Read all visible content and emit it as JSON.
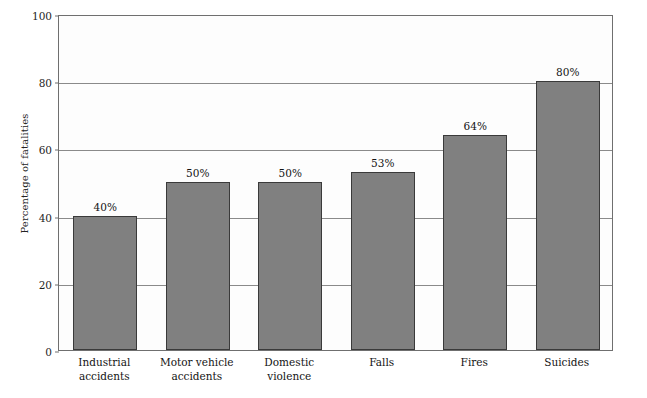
{
  "chart_data": {
    "type": "bar",
    "title": "",
    "xlabel": "",
    "ylabel": "Percentage of fatalities",
    "ylim": [
      0,
      100
    ],
    "yticks": [
      0,
      20,
      40,
      60,
      80,
      100
    ],
    "ytick_labels": [
      "0",
      "20",
      "40",
      "60",
      "80",
      "100"
    ],
    "grid": "horizontal",
    "legend": "none",
    "categories": [
      "Industrial accidents",
      "Motor vehicle accidents",
      "Domestic violence",
      "Falls",
      "Fires",
      "Suicides"
    ],
    "category_lines": [
      [
        "Industrial",
        "accidents"
      ],
      [
        "Motor vehicle",
        "accidents"
      ],
      [
        "Domestic",
        "violence"
      ],
      [
        "Falls"
      ],
      [
        "Fires"
      ],
      [
        "Suicides"
      ]
    ],
    "values": [
      40,
      50,
      50,
      53,
      64,
      80
    ],
    "value_labels": [
      "40%",
      "50%",
      "50%",
      "53%",
      "64%",
      "80%"
    ],
    "colors": {
      "bar_fill": "#808080",
      "bar_border": "#3a3a3a",
      "gridline": "#8a8a8a",
      "frame": "#6f6f6f",
      "background": "#ffffff",
      "plot_background": "#fdfdfd",
      "text": "#141414"
    }
  }
}
